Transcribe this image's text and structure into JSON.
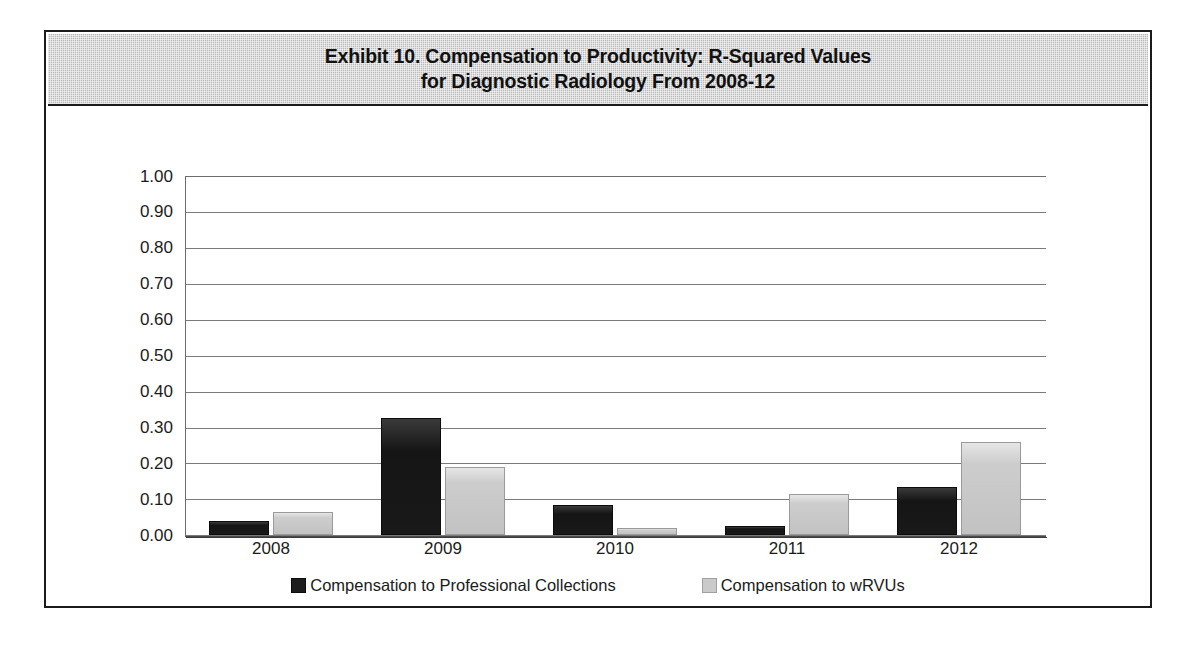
{
  "exhibit": {
    "title_line_1": "Exhibit 10. Compensation to Productivity: R-Squared Values",
    "title_line_2": "for Diagnostic Radiology From 2008-12"
  },
  "chart_data": {
    "type": "bar",
    "title": "Exhibit 10. Compensation to Productivity: R-Squared Values for Diagnostic Radiology From 2008-12",
    "xlabel": "",
    "ylabel": "",
    "ylim": [
      0,
      1
    ],
    "ytick_step": 0.1,
    "grid": true,
    "legend_position": "bottom",
    "categories": [
      "2008",
      "2009",
      "2010",
      "2011",
      "2012"
    ],
    "ytick_labels": [
      "1.00",
      "0.90",
      "0.80",
      "0.70",
      "0.60",
      "0.50",
      "0.40",
      "0.30",
      "0.20",
      "0.10",
      "0.00"
    ],
    "series": [
      {
        "name": "Compensation to Professional Collections",
        "color": "#1d1d1d",
        "values": [
          0.04,
          0.325,
          0.085,
          0.025,
          0.135
        ]
      },
      {
        "name": "Compensation to wRVUs",
        "color": "#cacaca",
        "values": [
          0.065,
          0.19,
          0.02,
          0.115,
          0.26
        ]
      }
    ]
  },
  "legend": {
    "entries": [
      {
        "label": "Compensation to Professional Collections",
        "swatch": "dark-square-marker"
      },
      {
        "label": "Compensation to wRVUs",
        "swatch": "light-square-marker"
      }
    ]
  }
}
